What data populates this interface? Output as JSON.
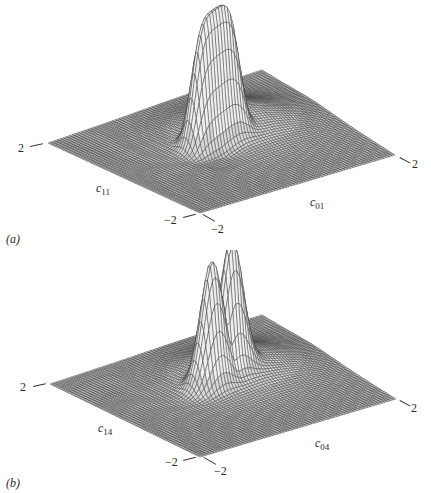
{
  "figure": {
    "panels": [
      {
        "id": "a",
        "label": "(a)",
        "axis_x_label": {
          "var": "c",
          "sub": "11"
        },
        "axis_y_label": {
          "var": "c",
          "sub": "01"
        },
        "ticks": {
          "left": "2",
          "front_left": "−2",
          "front_right": "−2",
          "right": "2"
        },
        "surface": "3D mesh surface with single tall ridge-like peak near centre"
      },
      {
        "id": "b",
        "label": "(b)",
        "axis_x_label": {
          "var": "c",
          "sub": "14"
        },
        "axis_y_label": {
          "var": "c",
          "sub": "04"
        },
        "ticks": {
          "left": "2",
          "front_left": "−2",
          "front_right": "−2",
          "right": "2"
        },
        "surface": "3D mesh surface with tall peak with two lobes near centre"
      }
    ],
    "colors": {
      "mesh": "#3a3a3a",
      "peak_face": "#e8e8e8",
      "background": "#ffffff"
    }
  }
}
